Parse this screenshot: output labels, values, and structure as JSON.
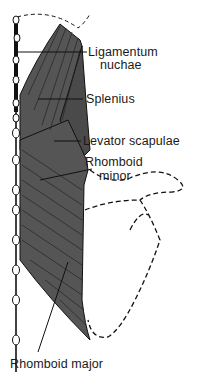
{
  "figure": {
    "colors": {
      "muscle_fill": "#555555",
      "muscle_fibers": "#222222",
      "outline": "#111111",
      "background": "#ffffff"
    },
    "labels": {
      "ligamentum_nuchae_line1": "Ligamentum",
      "ligamentum_nuchae_line2": "nuchae",
      "splenius": "Splenius",
      "levator_scapulae": "Levator scapulae",
      "rhomboid_minor_line1": "Rhomboid",
      "rhomboid_minor_line2": "minor",
      "rhomboid_major": "Rhomboid major"
    }
  }
}
